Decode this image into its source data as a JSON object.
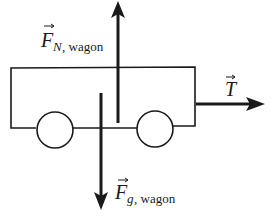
{
  "diagram": {
    "type": "free-body diagram",
    "subject": "wagon",
    "colors": {
      "ink": "#1a1a1a",
      "background": "#ffffff"
    },
    "forces": [
      {
        "id": "normal",
        "symbol": "F",
        "subscript": "N, wagon",
        "direction": "up"
      },
      {
        "id": "gravity",
        "symbol": "F",
        "subscript": "g, wagon",
        "direction": "down"
      },
      {
        "id": "tension",
        "symbol": "T",
        "subscript": "",
        "direction": "right"
      }
    ],
    "labels": {
      "normal_symbol": "F",
      "normal_sub_letter": "N",
      "normal_sub_rest": ", wagon",
      "gravity_symbol": "F",
      "gravity_sub_letter": "g",
      "gravity_sub_rest": ", wagon",
      "tension_symbol": "T"
    }
  }
}
